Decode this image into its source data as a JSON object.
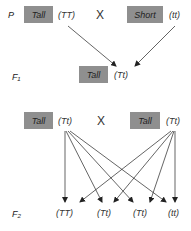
{
  "colors": {
    "box": "#8f8f8f",
    "line": "#222222",
    "text": "#222222"
  },
  "generations": {
    "P": {
      "label": "P",
      "parent1": {
        "phenotype": "Tall",
        "genotype": "(TT)"
      },
      "cross": "X",
      "parent2": {
        "phenotype": "Short",
        "genotype": "(tt)"
      }
    },
    "F1": {
      "label": "F₁",
      "offspring": {
        "phenotype": "Tall",
        "genotype": "(Tt)"
      }
    },
    "F1_cross": {
      "parent1": {
        "phenotype": "Tall",
        "genotype": "(Tt)"
      },
      "cross": "X",
      "parent2": {
        "phenotype": "Tall",
        "genotype": "(Tt)"
      }
    },
    "F2": {
      "label": "F₂",
      "offspring": [
        "(TT)",
        "(Tt)",
        "(Tt)",
        "(tt)"
      ]
    }
  }
}
